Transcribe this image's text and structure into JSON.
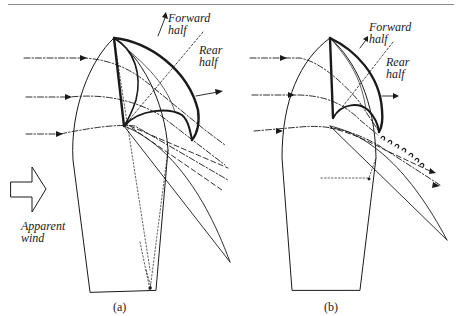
{
  "figure": {
    "panels": [
      {
        "id": "a",
        "caption": "(a)",
        "labels": {
          "forward": "Forward",
          "forward2": "half",
          "rear": "Rear",
          "rear2": "half"
        }
      },
      {
        "id": "b",
        "caption": "(b)",
        "labels": {
          "forward": "Forward",
          "forward2": "half",
          "rear": "Rear",
          "rear2": "half"
        }
      }
    ],
    "wind_label": {
      "line1": "Apparent",
      "line2": "wind"
    },
    "colors": {
      "ink": "#1a1a1a",
      "rule": "#8a8a8a",
      "background": "#ffffff"
    }
  }
}
